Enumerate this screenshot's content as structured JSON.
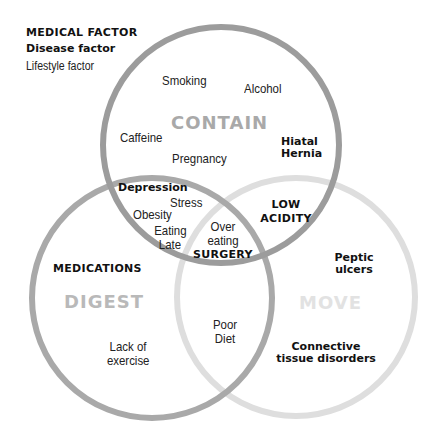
{
  "legend": {
    "medical": "MEDICAL FACTOR",
    "disease": "Disease factor",
    "lifestyle": "Lifestyle factor"
  },
  "circles": {
    "contain": {
      "label": "CONTAIN",
      "stroke": "#9c9c9c",
      "label_color": "#a9a9a9"
    },
    "digest": {
      "label": "DIGEST",
      "stroke": "#a9a9a9",
      "label_color": "#b9b9b9"
    },
    "move": {
      "label": "MOVE",
      "stroke": "#dedede",
      "label_color": "#e2e2e2"
    }
  },
  "factors": {
    "smoking": "Smoking",
    "alcohol": "Alcohol",
    "caffeine": "Caffeine",
    "pregnancy": "Pregnancy",
    "hiatal_hernia": [
      "Hiatal",
      "Hernia"
    ],
    "depression": "Depression",
    "stress": "Stress",
    "obesity": "Obesity",
    "eating_late": [
      "Eating",
      "Late"
    ],
    "over_eating": [
      "Over",
      "eating"
    ],
    "surgery": "SURGERY",
    "low_acidity": [
      "LOW",
      "ACIDITY"
    ],
    "medications": "MEDICATIONS",
    "lack_of_exercise": [
      "Lack of",
      "exercise"
    ],
    "poor_diet": [
      "Poor",
      "Diet"
    ],
    "peptic_ulcers": [
      "Peptic",
      "ulcers"
    ],
    "connective_tissue": [
      "Connective",
      "tissue disorders"
    ]
  }
}
